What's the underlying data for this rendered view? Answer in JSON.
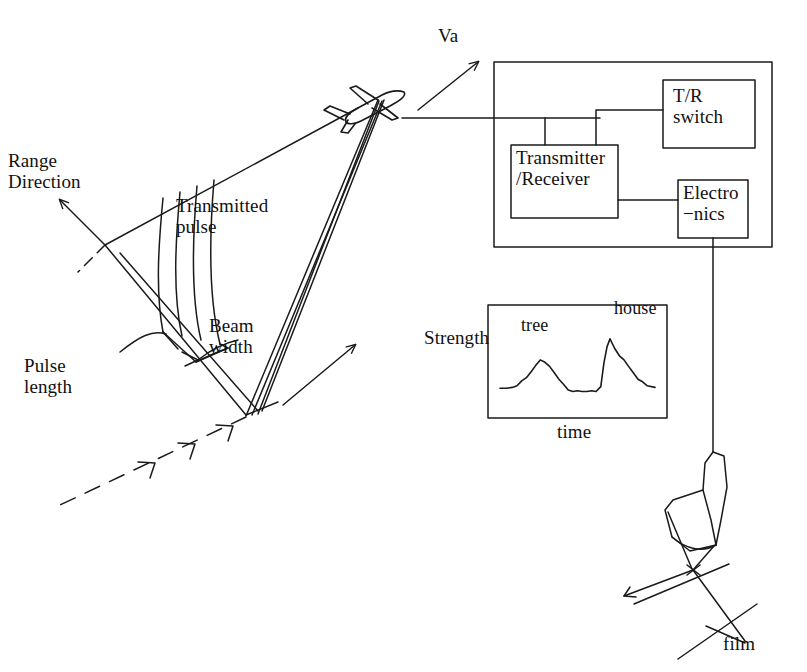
{
  "figure": {
    "stroke_color": "#1a1a1a",
    "background_color": "#ffffff"
  },
  "labels": {
    "range_direction": "Range\nDirection",
    "transmitted_pulse": "Transmitted\npulse",
    "beam_width": "Beam\nwidth",
    "pulse_length": "Pulse\nlength",
    "velocity": "Va",
    "tr_switch": "T/R\nswitch",
    "transmitter_receiver": "Transmitter\n/Receiver",
    "electronics": "Electro\n−nics",
    "strength": "Strength",
    "tree": "tree",
    "house": "house",
    "time": "time",
    "film": "film"
  },
  "blocks": [
    {
      "name": "transmitter-receiver",
      "label": "Transmitter\n/Receiver",
      "x": 511,
      "y": 145,
      "w": 107,
      "h": 73
    },
    {
      "name": "tr-switch",
      "label": "T/R\nswitch",
      "x": 663,
      "y": 80,
      "w": 92,
      "h": 68
    },
    {
      "name": "electronics",
      "label": "Electro\n−nics",
      "x": 678,
      "y": 180,
      "w": 70,
      "h": 58
    }
  ],
  "enclosure": {
    "name": "radar-enclosure",
    "x": 494,
    "y": 62,
    "w": 278,
    "h": 185
  },
  "chart_data": {
    "type": "line",
    "title": "",
    "xlabel": "time",
    "ylabel": "Strength",
    "grid": false,
    "legend": "none",
    "annotations": [
      {
        "text": "tree",
        "x": 0.27,
        "y": 0.62
      },
      {
        "text": "house",
        "x": 0.72,
        "y": 0.86
      }
    ],
    "plot_box": {
      "x": 488,
      "y": 305,
      "w": 179,
      "h": 113
    },
    "xlim": [
      0,
      1
    ],
    "ylim": [
      0,
      1
    ],
    "x": [
      0.0,
      0.04,
      0.08,
      0.11,
      0.14,
      0.17,
      0.2,
      0.23,
      0.26,
      0.29,
      0.32,
      0.35,
      0.38,
      0.41,
      0.44,
      0.47,
      0.5,
      0.53,
      0.56,
      0.59,
      0.62,
      0.65,
      0.67,
      0.69,
      0.71,
      0.74,
      0.77,
      0.8,
      0.83,
      0.86,
      0.89,
      0.92,
      0.95,
      1.0
    ],
    "values": [
      0.17,
      0.17,
      0.18,
      0.2,
      0.26,
      0.3,
      0.37,
      0.45,
      0.52,
      0.49,
      0.44,
      0.36,
      0.28,
      0.22,
      0.15,
      0.13,
      0.14,
      0.13,
      0.13,
      0.14,
      0.13,
      0.19,
      0.48,
      0.68,
      0.78,
      0.66,
      0.57,
      0.52,
      0.44,
      0.36,
      0.28,
      0.25,
      0.2,
      0.18
    ]
  },
  "geometry": {
    "aircraft": {
      "name": "aircraft-icon",
      "x": 340,
      "y": 88
    },
    "velocity_arrow": {
      "from": [
        418,
        110
      ],
      "to": [
        478,
        62
      ]
    },
    "azimuth_arrow": {
      "from": [
        283,
        405
      ],
      "to": [
        355,
        345
      ]
    },
    "range_arrow": {
      "from": [
        105,
        245
      ],
      "to": [
        60,
        200
      ]
    },
    "pulse_wavefronts": 4,
    "recorder": {
      "name": "film-recorder",
      "x": 690,
      "y": 450
    }
  }
}
